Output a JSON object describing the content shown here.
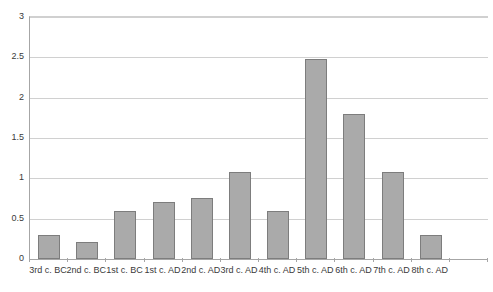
{
  "chart_data": {
    "type": "bar",
    "title": "",
    "subtitle": "",
    "xlabel": "",
    "ylabel": "",
    "ylim": [
      0,
      3
    ],
    "ytick_step": 0.5,
    "yticks": [
      "0",
      "0.5",
      "1",
      "1.5",
      "2",
      "2.5",
      "3"
    ],
    "grid": true,
    "legend": false,
    "categories": [
      "3rd c. BC",
      "2nd c. BC",
      "1st c. BC",
      "1st c. AD",
      "2nd c. AD",
      "3rd c. AD",
      "4th c. AD",
      "5th c. AD",
      "6th c. AD",
      "7th c. AD",
      "8th c. AD"
    ],
    "values": [
      0.3,
      0.21,
      0.6,
      0.71,
      0.76,
      1.08,
      0.6,
      2.48,
      1.8,
      1.08,
      0.3
    ],
    "bar_fill_color": "#aaaaaa",
    "bar_border_color": "#7d7d7d",
    "gridline_color": "#d0d0d0",
    "axis_color": "#a6a6a6",
    "background_color": "#ffffff",
    "empty_slot_index": 11,
    "slot_count": 12
  }
}
